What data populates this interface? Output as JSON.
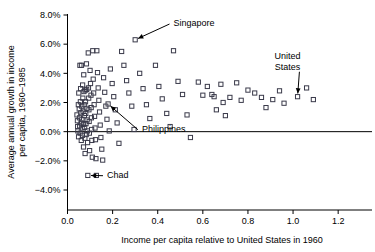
{
  "chart_data": {
    "type": "scatter",
    "title": "",
    "xlabel": "Income per capita relative to United States in 1960",
    "ylabel": "Average annual growth in income per capita, 1960–1985",
    "xlim": [
      0.0,
      1.35
    ],
    "ylim": [
      -0.04,
      0.08
    ],
    "xticks": [
      0.0,
      0.2,
      0.4,
      0.6,
      0.8,
      1.0,
      1.2
    ],
    "xtick_labels": [
      "0.0",
      "0.2",
      "0.4",
      "0.6",
      "0.8",
      "1.0",
      "1.2"
    ],
    "yticks": [
      -0.04,
      -0.02,
      0.0,
      0.02,
      0.04,
      0.06,
      0.08
    ],
    "ytick_labels": [
      "-4.0%",
      "-2.0%",
      "0.0%",
      "2.0%",
      "4.0%",
      "6.0%",
      "8.0%"
    ],
    "grid": false,
    "legend": null,
    "reference_lines": [
      {
        "orientation": "horizontal",
        "y": 0.0,
        "label": "zero-growth-line"
      }
    ],
    "marker_style": "open-square",
    "points": [
      {
        "x": 0.042,
        "y": 0.0115
      },
      {
        "x": 0.044,
        "y": 0.0075
      },
      {
        "x": 0.045,
        "y": 0.0035
      },
      {
        "x": 0.046,
        "y": 0.0005
      },
      {
        "x": 0.048,
        "y": 0.0185
      },
      {
        "x": 0.049,
        "y": -0.0035
      },
      {
        "x": 0.05,
        "y": 0.0265
      },
      {
        "x": 0.052,
        "y": 0.0155
      },
      {
        "x": 0.053,
        "y": 0.0095
      },
      {
        "x": 0.054,
        "y": 0.004
      },
      {
        "x": 0.055,
        "y": 0.0455
      },
      {
        "x": 0.056,
        "y": -0.001
      },
      {
        "x": 0.057,
        "y": 0.0205
      },
      {
        "x": 0.058,
        "y": 0.0295
      },
      {
        "x": 0.059,
        "y": 0.013
      },
      {
        "x": 0.06,
        "y": 0.006
      },
      {
        "x": 0.061,
        "y": -0.006
      },
      {
        "x": 0.062,
        "y": 0.0455
      },
      {
        "x": 0.063,
        "y": 0.0175
      },
      {
        "x": 0.064,
        "y": 0.0085
      },
      {
        "x": 0.065,
        "y": 0.0025
      },
      {
        "x": 0.066,
        "y": -0.0025
      },
      {
        "x": 0.067,
        "y": 0.032
      },
      {
        "x": 0.068,
        "y": 0.023
      },
      {
        "x": 0.069,
        "y": 0.014
      },
      {
        "x": 0.07,
        "y": 0.005
      },
      {
        "x": 0.071,
        "y": -0.0105
      },
      {
        "x": 0.072,
        "y": 0.039
      },
      {
        "x": 0.073,
        "y": 0.0275
      },
      {
        "x": 0.074,
        "y": 0.0185
      },
      {
        "x": 0.075,
        "y": 0.011
      },
      {
        "x": 0.076,
        "y": 0.003
      },
      {
        "x": 0.077,
        "y": -0.0045
      },
      {
        "x": 0.078,
        "y": -0.015
      },
      {
        "x": 0.079,
        "y": 0.0285
      },
      {
        "x": 0.08,
        "y": 0.0205
      },
      {
        "x": 0.081,
        "y": 0.0125
      },
      {
        "x": 0.082,
        "y": 0.0055
      },
      {
        "x": 0.083,
        "y": -0.002
      },
      {
        "x": 0.084,
        "y": 0.0465
      },
      {
        "x": 0.085,
        "y": 0.029
      },
      {
        "x": 0.086,
        "y": 0.016
      },
      {
        "x": 0.087,
        "y": 0.008
      },
      {
        "x": 0.088,
        "y": 0.0005
      },
      {
        "x": 0.089,
        "y": -0.0075
      },
      {
        "x": 0.09,
        "y": -0.03
      },
      {
        "x": 0.092,
        "y": 0.054
      },
      {
        "x": 0.093,
        "y": 0.03
      },
      {
        "x": 0.094,
        "y": 0.023
      },
      {
        "x": 0.095,
        "y": 0.015
      },
      {
        "x": 0.096,
        "y": 0.007
      },
      {
        "x": 0.097,
        "y": -0.001
      },
      {
        "x": 0.098,
        "y": -0.013
      },
      {
        "x": 0.1,
        "y": 0.042
      },
      {
        "x": 0.102,
        "y": 0.033
      },
      {
        "x": 0.104,
        "y": 0.025
      },
      {
        "x": 0.105,
        "y": 0.0165
      },
      {
        "x": 0.106,
        "y": 0.0095
      },
      {
        "x": 0.107,
        "y": 0.0015
      },
      {
        "x": 0.108,
        "y": -0.006
      },
      {
        "x": 0.11,
        "y": -0.0175
      },
      {
        "x": 0.112,
        "y": 0.0555
      },
      {
        "x": 0.114,
        "y": 0.036
      },
      {
        "x": 0.116,
        "y": 0.0265
      },
      {
        "x": 0.118,
        "y": 0.0185
      },
      {
        "x": 0.12,
        "y": 0.0105
      },
      {
        "x": 0.122,
        "y": 0.0025
      },
      {
        "x": 0.124,
        "y": -0.0055
      },
      {
        "x": 0.126,
        "y": -0.0185
      },
      {
        "x": 0.128,
        "y": -0.03
      },
      {
        "x": 0.13,
        "y": 0.0555
      },
      {
        "x": 0.133,
        "y": 0.0405
      },
      {
        "x": 0.136,
        "y": 0.03
      },
      {
        "x": 0.139,
        "y": 0.0215
      },
      {
        "x": 0.142,
        "y": 0.0135
      },
      {
        "x": 0.145,
        "y": 0.0045
      },
      {
        "x": 0.148,
        "y": -0.004
      },
      {
        "x": 0.152,
        "y": -0.012
      },
      {
        "x": 0.156,
        "y": -0.0195
      },
      {
        "x": 0.16,
        "y": 0.037
      },
      {
        "x": 0.165,
        "y": 0.027
      },
      {
        "x": 0.17,
        "y": 0.0175
      },
      {
        "x": 0.175,
        "y": 0.0085
      },
      {
        "x": 0.18,
        "y": 0.019
      },
      {
        "x": 0.185,
        "y": 0.0005
      },
      {
        "x": 0.19,
        "y": 0.043
      },
      {
        "x": 0.198,
        "y": 0.033
      },
      {
        "x": 0.205,
        "y": 0.024
      },
      {
        "x": 0.212,
        "y": 0.015
      },
      {
        "x": 0.22,
        "y": 0.006
      },
      {
        "x": 0.228,
        "y": -0.008
      },
      {
        "x": 0.24,
        "y": 0.055
      },
      {
        "x": 0.25,
        "y": 0.0455
      },
      {
        "x": 0.262,
        "y": 0.035
      },
      {
        "x": 0.272,
        "y": 0.0265
      },
      {
        "x": 0.285,
        "y": 0.0175
      },
      {
        "x": 0.295,
        "y": 0.0015
      },
      {
        "x": 0.3,
        "y": 0.063
      },
      {
        "x": 0.32,
        "y": 0.04
      },
      {
        "x": 0.335,
        "y": 0.0295
      },
      {
        "x": 0.35,
        "y": 0.0185
      },
      {
        "x": 0.365,
        "y": 0.009
      },
      {
        "x": 0.39,
        "y": 0.0455
      },
      {
        "x": 0.405,
        "y": 0.031
      },
      {
        "x": 0.42,
        "y": 0.0225
      },
      {
        "x": 0.44,
        "y": 0.0125
      },
      {
        "x": 0.455,
        "y": 0.0035
      },
      {
        "x": 0.47,
        "y": 0.0555
      },
      {
        "x": 0.49,
        "y": 0.0345
      },
      {
        "x": 0.51,
        "y": 0.0255
      },
      {
        "x": 0.53,
        "y": 0.0115
      },
      {
        "x": 0.545,
        "y": -0.004
      },
      {
        "x": 0.58,
        "y": 0.034
      },
      {
        "x": 0.6,
        "y": 0.025
      },
      {
        "x": 0.62,
        "y": 0.031
      },
      {
        "x": 0.64,
        "y": 0.0255
      },
      {
        "x": 0.65,
        "y": 0.024
      },
      {
        "x": 0.66,
        "y": 0.015
      },
      {
        "x": 0.68,
        "y": 0.0325
      },
      {
        "x": 0.69,
        "y": 0.02
      },
      {
        "x": 0.7,
        "y": 0.011
      },
      {
        "x": 0.72,
        "y": 0.0235
      },
      {
        "x": 0.75,
        "y": 0.0335
      },
      {
        "x": 0.77,
        "y": 0.0215
      },
      {
        "x": 0.8,
        "y": 0.0285
      },
      {
        "x": 0.83,
        "y": 0.0265
      },
      {
        "x": 0.86,
        "y": 0.0235
      },
      {
        "x": 0.88,
        "y": 0.0165
      },
      {
        "x": 0.91,
        "y": 0.022
      },
      {
        "x": 0.94,
        "y": 0.028
      },
      {
        "x": 0.96,
        "y": 0.0195
      },
      {
        "x": 1.02,
        "y": 0.024
      },
      {
        "x": 1.06,
        "y": 0.03
      },
      {
        "x": 1.09,
        "y": 0.022
      }
    ],
    "annotations": [
      {
        "label": "Singapore",
        "text_x": 0.47,
        "text_y": 0.0745,
        "point_x": 0.3,
        "point_y": 0.063
      },
      {
        "label": "United States",
        "text_x": 0.975,
        "text_y": 0.05,
        "point_x": 1.02,
        "point_y": 0.024
      },
      {
        "label": "Philippines",
        "text_x": 0.33,
        "text_y": 0.002,
        "point_x": 0.18,
        "point_y": 0.019
      },
      {
        "label": "Chad",
        "text_x": 0.175,
        "text_y": -0.0295,
        "point_x": 0.09,
        "point_y": -0.03
      }
    ]
  }
}
